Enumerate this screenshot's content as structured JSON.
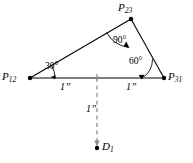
{
  "figure": {
    "type": "geometry-diagram",
    "stroke_color": "#000000",
    "dash_color": "#808080",
    "background": "#ffffff"
  },
  "vertices": [
    {
      "key": "p12",
      "base": "P",
      "sub": "12",
      "x": 30,
      "y": 78,
      "label_x": 2,
      "label_y": 71
    },
    {
      "key": "p23",
      "base": "P",
      "sub": "23",
      "x": 131,
      "y": 19,
      "label_x": 118,
      "label_y": 2
    },
    {
      "key": "p31",
      "base": "P",
      "sub": "31",
      "x": 164,
      "y": 78,
      "label_x": 168,
      "label_y": 71
    },
    {
      "key": "d1",
      "base": "D",
      "sub": "1",
      "x": 97,
      "y": 148,
      "label_x": 102,
      "label_y": 141
    }
  ],
  "angles": [
    {
      "key": "angle-p12",
      "value": "30°",
      "label_x": 45,
      "label_y": 62
    },
    {
      "key": "angle-p23",
      "value": "90°",
      "label_x": 113,
      "label_y": 36
    },
    {
      "key": "angle-p31",
      "value": "60°",
      "label_x": 129,
      "label_y": 57
    }
  ],
  "dimensions": [
    {
      "key": "dim-left",
      "value": "1”",
      "label_x": 60,
      "label_y": 82
    },
    {
      "key": "dim-right",
      "value": "1”",
      "label_x": 126,
      "label_y": 82
    },
    {
      "key": "dim-drop",
      "value": "1”",
      "label_x": 86,
      "label_y": 104
    }
  ]
}
